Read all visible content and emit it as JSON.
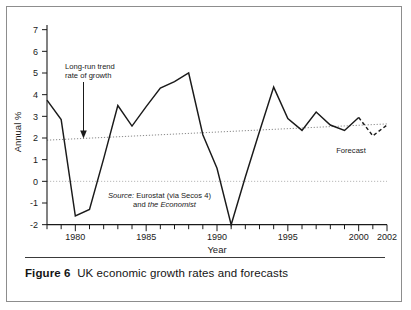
{
  "figure": {
    "number_label": "Figure 6",
    "caption_text": "UK economic growth rates and forecasts"
  },
  "chart_data": {
    "type": "line",
    "title": "UK economic growth rates and forecasts",
    "xlabel": "Year",
    "ylabel": "Annual %",
    "xlim": [
      1978,
      2002
    ],
    "ylim": [
      -2,
      7
    ],
    "ytick_labels": [
      "7",
      "6",
      "5",
      "4",
      "3",
      "2",
      "1",
      "0",
      "-1",
      "-2"
    ],
    "yticks": [
      7,
      6,
      5,
      4,
      3,
      2,
      1,
      0,
      -1,
      -2
    ],
    "xtick_labels": [
      "1980",
      "1985",
      "1990",
      "1995",
      "2000",
      "2002"
    ],
    "xticks_labeled": [
      1980,
      1985,
      1990,
      1995,
      2000,
      2002
    ],
    "xticks_minor_every": 1,
    "grid": false,
    "zero_line": 0,
    "legend": "none",
    "series": [
      {
        "name": "UK annual growth (actual)",
        "style": "solid",
        "x": [
          1978,
          1979,
          1980,
          1981,
          1982,
          1983,
          1984,
          1985,
          1986,
          1987,
          1988,
          1989,
          1990,
          1991,
          1992,
          1993,
          1994,
          1995,
          1996,
          1997,
          1998,
          1999,
          2000
        ],
        "values": [
          3.75,
          2.85,
          -1.6,
          -1.3,
          1.05,
          3.5,
          2.55,
          3.45,
          4.3,
          4.6,
          5.0,
          2.15,
          0.6,
          -2.0,
          0.2,
          2.3,
          4.35,
          2.9,
          2.35,
          3.2,
          2.6,
          2.35,
          2.95
        ]
      },
      {
        "name": "Forecast",
        "style": "dashed",
        "x": [
          2000,
          2001,
          2002
        ],
        "values": [
          2.95,
          2.1,
          2.6
        ]
      },
      {
        "name": "Long-run trend rate of growth",
        "style": "dotted",
        "x": [
          1978,
          2002
        ],
        "values": [
          1.9,
          2.65
        ]
      }
    ],
    "annotations": [
      {
        "name": "trend-annotation",
        "lines": [
          "Long-run trend",
          "rate of growth"
        ],
        "arrow": "down",
        "points_to_x": 1980.6,
        "points_to_y": 2.1
      },
      {
        "name": "source-note",
        "line1_italic": "Source:",
        "line1_rest": " Eurostat (via Secos 4)",
        "line2_rest": "and ",
        "line2_italic": "the Economist"
      },
      {
        "name": "forecast-label",
        "text": "Forecast"
      }
    ],
    "colors": {
      "data_line": "#1a1a1a",
      "trend_line": "#808080",
      "zero_line": "#b3b3b3",
      "axis": "#1a1a1a",
      "background": "#ffffff",
      "frame_border": "#8d8d8d"
    }
  }
}
